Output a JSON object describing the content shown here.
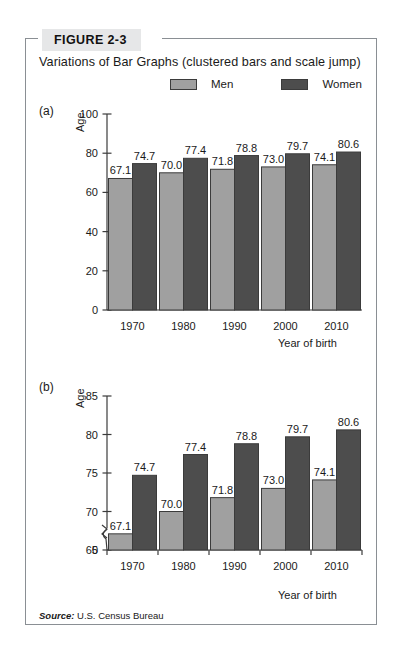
{
  "figure": {
    "tag": "FIGURE 2-3",
    "title": "Variations of Bar Graphs (clustered bars and scale jump)",
    "source_word": "Source:",
    "source_text": " U.S. Census Bureau"
  },
  "legend": {
    "items": [
      {
        "label": "Men",
        "color": "#a0a0a0",
        "icon": "legend-swatch-men"
      },
      {
        "label": "Women",
        "color": "#4d4d4d",
        "icon": "legend-swatch-women"
      }
    ]
  },
  "panels": {
    "a": {
      "letter": "(a)"
    },
    "b": {
      "letter": "(b)"
    }
  },
  "chart_data": [
    {
      "id": "panel-a",
      "type": "bar",
      "title": "",
      "panel_label": "(a)",
      "xlabel": "Year of birth",
      "ylabel": "Age",
      "categories": [
        "1970",
        "1980",
        "1990",
        "2000",
        "2010"
      ],
      "series": [
        {
          "name": "Men",
          "values": [
            67.1,
            70.0,
            71.8,
            73.0,
            74.1
          ],
          "color": "#a0a0a0"
        },
        {
          "name": "Women",
          "values": [
            74.7,
            77.4,
            78.8,
            79.7,
            80.6
          ],
          "color": "#4d4d4d"
        }
      ],
      "ylim": [
        0,
        100
      ],
      "yticks": [
        0,
        20,
        40,
        60,
        80,
        100
      ],
      "ytick_labels": [
        "0",
        "20",
        "40",
        "60",
        "80",
        "100"
      ],
      "grid": false,
      "scale_break": false,
      "legend_position": "top",
      "data_labels": true
    },
    {
      "id": "panel-b",
      "type": "bar",
      "title": "",
      "panel_label": "(b)",
      "xlabel": "Year of birth",
      "ylabel": "Age",
      "categories": [
        "1970",
        "1980",
        "1990",
        "2000",
        "2010"
      ],
      "series": [
        {
          "name": "Men",
          "values": [
            67.1,
            70.0,
            71.8,
            73.0,
            74.1
          ],
          "color": "#a0a0a0"
        },
        {
          "name": "Women",
          "values": [
            74.7,
            77.4,
            78.8,
            79.7,
            80.6
          ],
          "color": "#4d4d4d"
        }
      ],
      "ylim": [
        65,
        85
      ],
      "yticks": [
        65,
        70,
        75,
        80,
        85
      ],
      "ytick_labels": [
        "65",
        "70",
        "75",
        "80",
        "85"
      ],
      "axis_origin_label": "0",
      "grid": false,
      "scale_break": true,
      "legend_position": "top",
      "data_labels": true
    }
  ]
}
